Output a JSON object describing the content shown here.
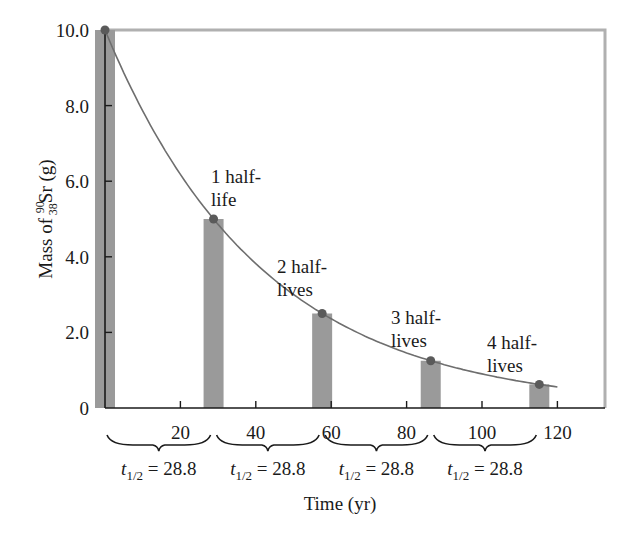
{
  "chart_data": {
    "type": "bar",
    "title": "",
    "xlabel": "Time (yr)",
    "ylabel": {
      "prefix": "Mass of ",
      "mass_number": "90",
      "atomic_number": "38",
      "symbol": "Sr",
      "suffix": " (g)"
    },
    "xlim": [
      0,
      130
    ],
    "ylim": [
      0,
      10.0
    ],
    "x_ticks": [
      20,
      40,
      60,
      80,
      100,
      120
    ],
    "x_tick_labels": [
      "20",
      "40",
      "60",
      "80",
      "100",
      "120"
    ],
    "y_ticks": [
      0,
      2.0,
      4.0,
      6.0,
      8.0,
      10.0
    ],
    "y_tick_labels": [
      "0",
      "2.0",
      "4.0",
      "6.0",
      "8.0",
      "10.0"
    ],
    "grid": false,
    "legend": null,
    "series": [
      {
        "name": "Remaining mass of Sr-90",
        "type": "bar",
        "x": [
          0,
          28.8,
          57.6,
          86.4,
          115.2
        ],
        "values": [
          10.0,
          5.0,
          2.5,
          1.25,
          0.625
        ]
      },
      {
        "name": "Decay curve",
        "type": "line",
        "equation": "m = 10.0 * (1/2)^(t/28.8)",
        "x": [
          0,
          28.8,
          57.6,
          86.4,
          115.2
        ],
        "values": [
          10.0,
          5.0,
          2.5,
          1.25,
          0.625
        ]
      }
    ],
    "annotations": [
      {
        "label_line1": "1 half-",
        "label_line2": "life",
        "x": 28.8,
        "y": 5.0
      },
      {
        "label_line1": "2 half-",
        "label_line2": "lives",
        "x": 57.6,
        "y": 2.5
      },
      {
        "label_line1": "3 half-",
        "label_line2": "lives",
        "x": 86.4,
        "y": 1.25
      },
      {
        "label_line1": "4 half-",
        "label_line2": "lives",
        "x": 115.2,
        "y": 0.625
      }
    ],
    "half_life_brackets": [
      {
        "symbol": "t",
        "subscript": "1/2",
        "value_text": " = 28.8",
        "from": 0,
        "to": 28.8
      },
      {
        "symbol": "t",
        "subscript": "1/2",
        "value_text": " = 28.8",
        "from": 28.8,
        "to": 57.6
      },
      {
        "symbol": "t",
        "subscript": "1/2",
        "value_text": " = 28.8",
        "from": 57.6,
        "to": 86.4
      },
      {
        "symbol": "t",
        "subscript": "1/2",
        "value_text": " = 28.8",
        "from": 86.4,
        "to": 115.2
      }
    ]
  },
  "colors": {
    "bar": "#9a9a9a",
    "curve": "#6e6e6e",
    "point": "#5a5a5a",
    "axis": "#1a1a1a",
    "frame": "#b0b0b0",
    "text": "#1a1a1a"
  }
}
